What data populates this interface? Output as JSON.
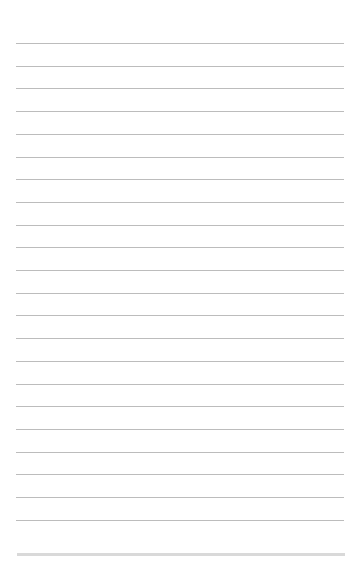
{
  "page": {
    "type": "lined-paper",
    "background_color": "#ffffff",
    "rule_color": "#bcbcbc",
    "band_color": "#d9d9d9",
    "rule_count": 22,
    "first_rule_y": 43,
    "rule_spacing": 22.7,
    "rule_left": 16,
    "rule_width": 328,
    "bottom_band_y": 553,
    "bottom_band_height": 3
  }
}
